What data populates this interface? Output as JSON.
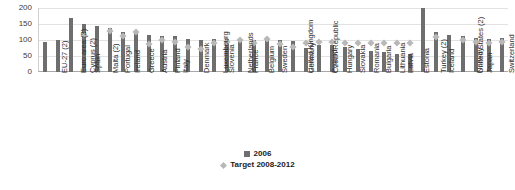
{
  "chart_data": {
    "type": "bar",
    "title": "",
    "xlabel": "",
    "ylabel": "",
    "ylim": [
      0,
      200
    ],
    "yticks": [
      0,
      50,
      100,
      150,
      200
    ],
    "grid": true,
    "legend_position": "bottom",
    "categories": [
      "EU-27 (2)",
      "Euro area (3)",
      "Cyprus (2)",
      "Spain",
      "Malta (2)",
      "Portugal",
      "Ireland",
      "Greece",
      "Austria",
      "Finland",
      "Italy",
      "Denmark",
      "Luxembourg",
      "Slovenia",
      "Netherlands",
      "France",
      "Belgium",
      "Sweden",
      "United Kingdom",
      "Germany",
      "Czech Republic",
      "Poland",
      "Hungary",
      "Slovakia",
      "Romania",
      "Bulgaria",
      "Lithuania",
      "Latvia",
      "Estonia",
      "Turkey (2)",
      "Iceland",
      "United States (2)",
      "Norway",
      "Japan",
      "Switzerland",
      "Croatia"
    ],
    "series": [
      {
        "name": "2006",
        "marker": "bar",
        "color": "#6e6e6e",
        "values": [
          93,
          101,
          170,
          150,
          145,
          138,
          126,
          125,
          115,
          113,
          113,
          103,
          100,
          102,
          102,
          102,
          100,
          99,
          99,
          97,
          76,
          84,
          83,
          78,
          72,
          67,
          61,
          56,
          55,
          200,
          125,
          117,
          111,
          105,
          102,
          105
        ]
      },
      {
        "name": "Target 2008-2012",
        "marker": "diamond",
        "color": "#b8b8b8",
        "values": [
          null,
          null,
          null,
          115,
          null,
          127,
          113,
          125,
          87,
          100,
          93,
          79,
          72,
          92,
          94,
          100,
          92,
          104,
          87,
          79,
          92,
          94,
          94,
          92,
          92,
          92,
          92,
          92,
          92,
          null,
          110,
          null,
          101,
          94,
          92,
          95
        ]
      }
    ]
  },
  "legend": {
    "entries": [
      {
        "label": "2006",
        "marker": "square"
      },
      {
        "label": "Target 2008-2012",
        "marker": "diamond"
      }
    ]
  }
}
